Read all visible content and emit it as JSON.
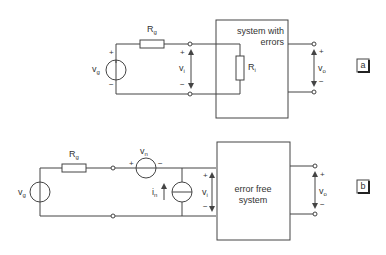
{
  "diagram_a": {
    "tag": "a",
    "source_label": "v",
    "source_sub": "g",
    "resistor_label": "R",
    "resistor_sub": "g",
    "input_voltage_label": "v",
    "input_voltage_sub": "i",
    "input_resistor_label": "R",
    "input_resistor_sub": "i",
    "output_voltage_label": "v",
    "output_voltage_sub": "o",
    "box_line1": "system with",
    "box_line2": "errors",
    "plus": "+",
    "minus": "−"
  },
  "diagram_b": {
    "tag": "b",
    "source_label": "v",
    "source_sub": "g",
    "resistor_label": "R",
    "resistor_sub": "g",
    "noise_voltage_label": "v",
    "noise_voltage_sub": "n",
    "noise_current_label": "i",
    "noise_current_sub": "n",
    "input_voltage_label": "v",
    "input_voltage_sub": "i",
    "output_voltage_label": "v",
    "output_voltage_sub": "o",
    "box_line1": "error free",
    "box_line2": "system",
    "plus": "+",
    "minus": "−"
  }
}
